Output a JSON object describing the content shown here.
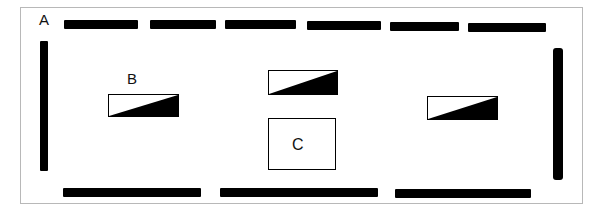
{
  "diagram": {
    "type": "floor-plan-layout",
    "labels": {
      "a": "A",
      "b": "B",
      "c": "C"
    },
    "colors": {
      "bar": "#000000",
      "frame": "#b8b8b8",
      "background": "#ffffff"
    },
    "elements": {
      "top_bars": 6,
      "bottom_bars": 3,
      "side_bars": 2,
      "wedge_boxes": 3,
      "plain_boxes": 1
    }
  }
}
